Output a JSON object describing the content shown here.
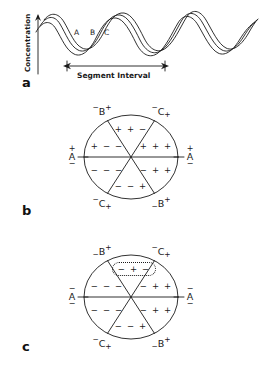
{
  "figure": {
    "panels": [
      {
        "letter": "a",
        "type": "wave-plot",
        "y_axis_label": "Concentration",
        "interval_label": "Segment Interval",
        "wave_labels": [
          "A",
          "B",
          "C"
        ]
      },
      {
        "letter": "b",
        "type": "sector-circle",
        "axis_labels": {
          "top_left": {
            "pre": "−",
            "letter": "B",
            "post": "+"
          },
          "top_right": {
            "pre": "−",
            "letter": "C",
            "post": "+"
          },
          "bottom_left": {
            "pre": "−",
            "letter": "C",
            "post": "+"
          },
          "bottom_right": {
            "pre": "−",
            "letter": "B",
            "post": "+"
          },
          "left": {
            "letter": "A",
            "above": "+",
            "below": "−"
          },
          "right": {
            "letter": "A",
            "above": "+",
            "below": "−"
          }
        },
        "sectors": [
          {
            "position": "top",
            "signs": "+ + −"
          },
          {
            "position": "upper-right",
            "signs": "+ + +"
          },
          {
            "position": "lower-right",
            "signs": "− + +"
          },
          {
            "position": "bottom",
            "signs": "− − +"
          },
          {
            "position": "lower-left",
            "signs": "− − −"
          },
          {
            "position": "upper-left",
            "signs": "+ − −"
          }
        ],
        "highlighted_sector": null
      },
      {
        "letter": "c",
        "type": "sector-circle",
        "axis_labels": {
          "top_left": {
            "pre": "−",
            "letter": "B",
            "post": "+"
          },
          "top_right": {
            "pre": "−",
            "letter": "C",
            "post": "+"
          },
          "bottom_left": {
            "pre": "−",
            "letter": "C",
            "post": "+"
          },
          "bottom_right": {
            "pre": "−",
            "letter": "B",
            "post": "+"
          },
          "left": {
            "letter": "A",
            "above": "−",
            "below": "−"
          },
          "right": {
            "letter": "A",
            "above": "−",
            "below": "−"
          }
        },
        "sectors": [
          {
            "position": "top",
            "signs": "− + −"
          },
          {
            "position": "upper-right",
            "signs": "− + +"
          },
          {
            "position": "lower-right",
            "signs": "− + +"
          },
          {
            "position": "bottom",
            "signs": "− − +"
          },
          {
            "position": "lower-left",
            "signs": "− − −"
          },
          {
            "position": "upper-left",
            "signs": "− − −"
          }
        ],
        "highlighted_sector": "top"
      }
    ],
    "colors": {
      "stroke": "#1a1a1a",
      "background": "#ffffff"
    }
  }
}
